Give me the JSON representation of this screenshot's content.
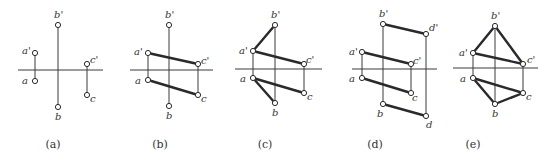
{
  "figure": {
    "width": 555,
    "height": 165,
    "colors": {
      "line": "#2a2a2a",
      "label": "#333333",
      "background": "#ffffff"
    },
    "panels": [
      {
        "id": "a",
        "caption": "(a)",
        "caption_pos": [
          53,
          148
        ],
        "axis": {
          "x1": 18,
          "x2": 103,
          "y": 70
        },
        "points": [
          {
            "name": "a'",
            "x": 35,
            "y": 53,
            "lx": 22,
            "ly": 54
          },
          {
            "name": "a",
            "x": 35,
            "y": 81,
            "lx": 22,
            "ly": 84
          },
          {
            "name": "b'",
            "x": 58,
            "y": 25,
            "lx": 54,
            "ly": 18
          },
          {
            "name": "b",
            "x": 58,
            "y": 107,
            "lx": 55,
            "ly": 120
          },
          {
            "name": "c'",
            "x": 87,
            "y": 64,
            "lx": 90,
            "ly": 63
          },
          {
            "name": "c",
            "x": 87,
            "y": 95,
            "lx": 90,
            "ly": 102
          }
        ],
        "thin_lines": [
          [
            "a'",
            "a"
          ],
          [
            "b'",
            "b"
          ],
          [
            "c'",
            "c"
          ]
        ],
        "thick_lines": []
      },
      {
        "id": "b",
        "caption": "(b)",
        "caption_pos": [
          160,
          148
        ],
        "axis": {
          "x1": 130,
          "x2": 213,
          "y": 70
        },
        "points": [
          {
            "name": "a'",
            "x": 148,
            "y": 53,
            "lx": 134,
            "ly": 55
          },
          {
            "name": "a",
            "x": 148,
            "y": 80,
            "lx": 135,
            "ly": 84
          },
          {
            "name": "b'",
            "x": 169,
            "y": 25,
            "lx": 165,
            "ly": 18
          },
          {
            "name": "b",
            "x": 169,
            "y": 106,
            "lx": 166,
            "ly": 119
          },
          {
            "name": "c'",
            "x": 198,
            "y": 64,
            "lx": 201,
            "ly": 64
          },
          {
            "name": "c",
            "x": 198,
            "y": 95,
            "lx": 201,
            "ly": 102
          }
        ],
        "thin_lines": [
          [
            "a'",
            "a"
          ],
          [
            "b'",
            "b"
          ],
          [
            "c'",
            "c"
          ]
        ],
        "thick_lines": [
          [
            "a'",
            "c'"
          ],
          [
            "a",
            "c"
          ]
        ]
      },
      {
        "id": "c",
        "caption": "(c)",
        "caption_pos": [
          265,
          148
        ],
        "axis": {
          "x1": 235,
          "x2": 322,
          "y": 69
        },
        "points": [
          {
            "name": "a'",
            "x": 253,
            "y": 51,
            "lx": 239,
            "ly": 54
          },
          {
            "name": "a",
            "x": 253,
            "y": 78,
            "lx": 240,
            "ly": 82
          },
          {
            "name": "b'",
            "x": 275,
            "y": 25,
            "lx": 271,
            "ly": 18
          },
          {
            "name": "b",
            "x": 275,
            "y": 103,
            "lx": 272,
            "ly": 116
          },
          {
            "name": "c'",
            "x": 304,
            "y": 64,
            "lx": 306,
            "ly": 63
          },
          {
            "name": "c",
            "x": 304,
            "y": 93,
            "lx": 307,
            "ly": 100
          }
        ],
        "thin_lines": [
          [
            "a'",
            "a"
          ],
          [
            "b'",
            "b"
          ],
          [
            "c'",
            "c"
          ]
        ],
        "thick_lines": [
          [
            "a'",
            "c'"
          ],
          [
            "a",
            "c"
          ],
          [
            "a'",
            "b'"
          ],
          [
            "a",
            "b"
          ]
        ]
      },
      {
        "id": "d",
        "caption": "(d)",
        "caption_pos": [
          375,
          148
        ],
        "axis": {
          "x1": 352,
          "x2": 437,
          "y": 69
        },
        "points": [
          {
            "name": "a'",
            "x": 362,
            "y": 52,
            "lx": 349,
            "ly": 55
          },
          {
            "name": "a",
            "x": 362,
            "y": 78,
            "lx": 349,
            "ly": 82
          },
          {
            "name": "b'",
            "x": 383,
            "y": 24,
            "lx": 379,
            "ly": 17
          },
          {
            "name": "b",
            "x": 383,
            "y": 104,
            "lx": 377,
            "ly": 117
          },
          {
            "name": "c'",
            "x": 411,
            "y": 64,
            "lx": 413,
            "ly": 64
          },
          {
            "name": "c",
            "x": 411,
            "y": 93,
            "lx": 412,
            "ly": 101
          },
          {
            "name": "d'",
            "x": 426,
            "y": 34,
            "lx": 429,
            "ly": 31
          },
          {
            "name": "d",
            "x": 426,
            "y": 116,
            "lx": 426,
            "ly": 128
          }
        ],
        "thin_lines": [
          [
            "a'",
            "a"
          ],
          [
            "b'",
            "b"
          ],
          [
            "c'",
            "c"
          ],
          [
            "d'",
            "d"
          ]
        ],
        "thick_lines": [
          [
            "a'",
            "c'"
          ],
          [
            "a",
            "c"
          ],
          [
            "b'",
            "d'"
          ],
          [
            "b",
            "d"
          ]
        ]
      },
      {
        "id": "e",
        "caption": "(e)",
        "caption_pos": [
          473,
          148
        ],
        "axis": {
          "x1": 453,
          "x2": 538,
          "y": 68
        },
        "points": [
          {
            "name": "a'",
            "x": 473,
            "y": 53,
            "lx": 459,
            "ly": 56
          },
          {
            "name": "a",
            "x": 473,
            "y": 78,
            "lx": 460,
            "ly": 82
          },
          {
            "name": "b'",
            "x": 495,
            "y": 26,
            "lx": 491,
            "ly": 19
          },
          {
            "name": "b",
            "x": 495,
            "y": 104,
            "lx": 492,
            "ly": 117
          },
          {
            "name": "c'",
            "x": 523,
            "y": 64,
            "lx": 527,
            "ly": 63
          },
          {
            "name": "c",
            "x": 523,
            "y": 93,
            "lx": 526,
            "ly": 100
          }
        ],
        "thin_lines": [
          [
            "a'",
            "a"
          ],
          [
            "b'",
            "b"
          ],
          [
            "c'",
            "c"
          ]
        ],
        "thick_lines": [
          [
            "a'",
            "c'"
          ],
          [
            "a",
            "c"
          ],
          [
            "a'",
            "b'"
          ],
          [
            "b'",
            "c'"
          ],
          [
            "a",
            "b"
          ],
          [
            "b",
            "c"
          ]
        ]
      }
    ]
  }
}
